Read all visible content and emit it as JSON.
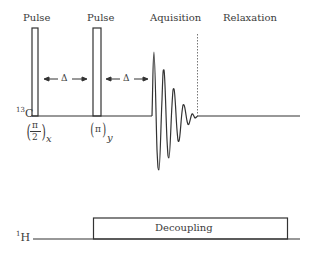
{
  "carbon_channel": {
    "nucleus_mass": "13",
    "nucleus_symbol": "C",
    "pulses": [
      {
        "label": "Pulse",
        "phase_num": "π",
        "phase_den": "2",
        "phase_axis": "x"
      },
      {
        "label": "Pulse",
        "phase_num": "π",
        "phase_den": "",
        "phase_axis": "y"
      }
    ],
    "delays": [
      {
        "symbol": "Δ"
      },
      {
        "symbol": "Δ"
      }
    ],
    "acquisition_label": "Aquisition",
    "relaxation_label": "Relaxation"
  },
  "proton_channel": {
    "nucleus_mass": "1",
    "nucleus_symbol": "H",
    "decoupling_label": "Decoupling"
  },
  "colors": {
    "line": "#333333",
    "text": "#3a3a3a",
    "dotted": "#777777"
  }
}
